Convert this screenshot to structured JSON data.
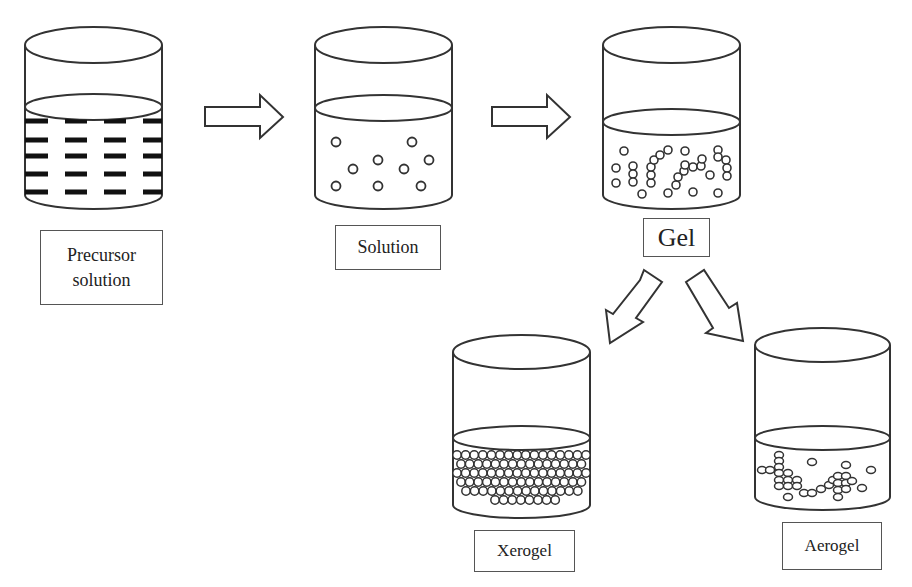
{
  "diagram": {
    "type": "process-flow",
    "stages": [
      {
        "id": "precursor",
        "label": "Precursor solution",
        "label_lines": [
          "Precursor",
          "solution"
        ],
        "content": "dashes"
      },
      {
        "id": "solution",
        "label": "Solution",
        "content": "sparse-circles"
      },
      {
        "id": "gel",
        "label": "Gel",
        "content": "chained-circles"
      },
      {
        "id": "xerogel",
        "label": "Xerogel",
        "content": "densely-packed-circles"
      },
      {
        "id": "aerogel",
        "label": "Aerogel",
        "content": "loose-network-circles"
      }
    ],
    "connections": [
      {
        "from": "precursor",
        "to": "solution",
        "arrow": "right"
      },
      {
        "from": "solution",
        "to": "gel",
        "arrow": "right"
      },
      {
        "from": "gel",
        "to": "xerogel",
        "arrow": "down-left"
      },
      {
        "from": "gel",
        "to": "aerogel",
        "arrow": "down-right"
      }
    ],
    "colors": {
      "stroke": "#333333",
      "background": "#ffffff",
      "particle_fill": "#ffffff"
    }
  }
}
